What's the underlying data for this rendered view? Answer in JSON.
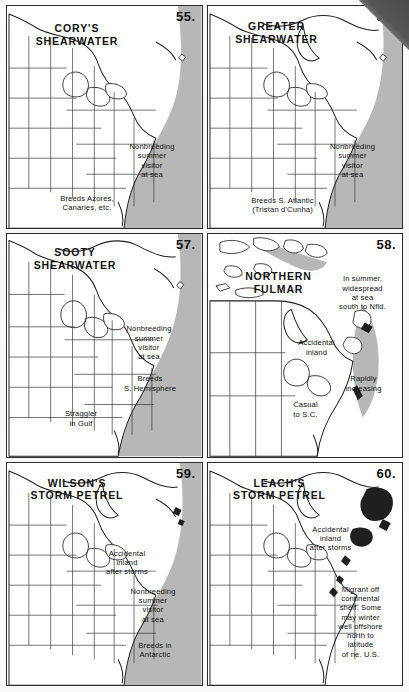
{
  "page": {
    "kind": "field-guide-range-maps",
    "background_color": "#fdfdfd",
    "ocean_shade_color": "#b7b7b7",
    "ink_color": "#1f1f1f",
    "corner_fold_color": "#4a4a4a"
  },
  "panels": [
    {
      "number": "55.",
      "title": "CORY'S\nSHEARWATER",
      "notes": [
        {
          "name": "ocean-note",
          "text": "Nonbreeding\nsummer\nvisitor\nat sea"
        },
        {
          "name": "breeding-note",
          "text": "Breeds Azores,\nCanaries, etc."
        }
      ]
    },
    {
      "number": "56.",
      "title": "GREATER\nSHEARWATER",
      "notes": [
        {
          "name": "ocean-note",
          "text": "Nonbreeding\nsummer\nvisitor\nat sea"
        },
        {
          "name": "breeding-note",
          "text": "Breeds S. Atlantic\n(Tristan d'Cunha)"
        }
      ]
    },
    {
      "number": "57.",
      "title": "SOOTY\nSHEARWATER",
      "notes": [
        {
          "name": "ocean-note",
          "text": "Nonbreeding\nsummer\nvisitor\nat sea"
        },
        {
          "name": "breeding-note",
          "text": "Breeds\nS. Hemisphere"
        },
        {
          "name": "straggler-note",
          "text": "Straggler\nin Gulf"
        }
      ]
    },
    {
      "number": "58.",
      "title": "NORTHERN\nFULMAR",
      "notes": [
        {
          "name": "summer-range-note",
          "text": "In summer,\nwidespread\nat sea\nsouth to Nfld."
        },
        {
          "name": "accidental-note",
          "text": "Accidental\ninland"
        },
        {
          "name": "trend-note",
          "text": "Rapidly\nincreasing"
        },
        {
          "name": "casual-note",
          "text": "Casual\nto S.C."
        }
      ]
    },
    {
      "number": "59.",
      "title": "WILSON'S\nSTORM PETREL",
      "notes": [
        {
          "name": "accidental-note",
          "text": "Accidental\ninland\nafter storms"
        },
        {
          "name": "ocean-note",
          "text": "Nonbreeding\nsummer\nvisitor\nat sea"
        },
        {
          "name": "breeding-note",
          "text": "Breeds in\nAntarctic"
        }
      ]
    },
    {
      "number": "60.",
      "title": "LEACH'S\nSTORM PETREL",
      "notes": [
        {
          "name": "accidental-note",
          "text": "Accidental\ninland\nafter storms"
        },
        {
          "name": "ocean-note",
          "text": "Migrant off\ncontinental\nshelf. Some\nmay winter\nwell offshore\nnorth to\nlatitude\nof ne. U.S."
        }
      ]
    }
  ]
}
